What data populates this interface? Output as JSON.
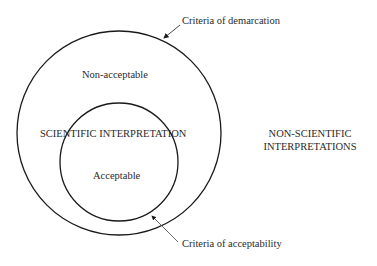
{
  "diagram": {
    "outer_region": {
      "label": "Non-acceptable",
      "boundary_label": "Criteria of demarcation"
    },
    "inner_region": {
      "label": "Acceptable",
      "boundary_label": "Criteria of acceptability"
    },
    "scientific_label": "SCIENTIFIC INTERPRETATION",
    "outside_label_line1": "NON-SCIENTIFIC",
    "outside_label_line2": "INTERPRETATIONS",
    "stroke_color": "#1a1a1a"
  }
}
